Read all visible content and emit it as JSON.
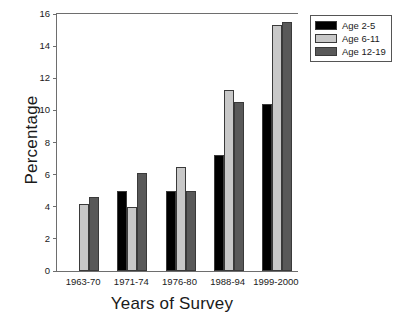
{
  "chart_data": {
    "type": "bar",
    "title": "",
    "xlabel": "Years of Survey",
    "ylabel": "Percentage",
    "categories": [
      "1963-70",
      "1971-74",
      "1976-80",
      "1988-94",
      "1999-2000"
    ],
    "series": [
      {
        "name": "Age 2-5",
        "color": "#000000",
        "values": [
          null,
          5.0,
          5.0,
          7.2,
          10.4
        ]
      },
      {
        "name": "Age 6-11",
        "color": "#c8c8c8",
        "values": [
          4.2,
          4.0,
          6.5,
          11.3,
          15.3
        ]
      },
      {
        "name": "Age 12-19",
        "color": "#595959",
        "values": [
          4.6,
          6.1,
          5.0,
          10.5,
          15.5
        ]
      }
    ],
    "ylim": [
      0,
      16
    ],
    "yticks": [
      0,
      2,
      4,
      6,
      8,
      10,
      12,
      14,
      16
    ],
    "ytick_labels": [
      "0",
      "2",
      "4",
      "6",
      "8",
      "10",
      "12",
      "14",
      "16"
    ],
    "grid": false,
    "legend_position": "top-right"
  },
  "axes": {
    "y_title": "Percentage",
    "x_title": "Years of Survey"
  },
  "legend": {
    "entries": [
      {
        "label": "Age 2-5",
        "color": "#000000"
      },
      {
        "label": "Age 6-11",
        "color": "#c8c8c8"
      },
      {
        "label": "Age 12-19",
        "color": "#595959"
      }
    ]
  }
}
